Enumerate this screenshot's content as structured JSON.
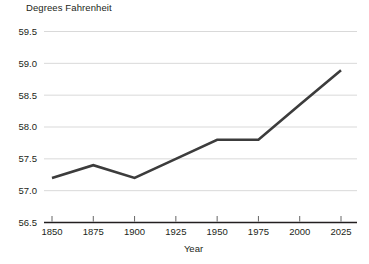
{
  "chart_data": {
    "type": "line",
    "title": "",
    "xlabel": "Year",
    "ylabel": "Degrees Fahrenheit",
    "x": [
      1850,
      1875,
      1900,
      1925,
      1950,
      1975,
      2000,
      2025
    ],
    "values": [
      57.2,
      57.4,
      57.2,
      57.5,
      57.8,
      57.8,
      58.35,
      58.89
    ],
    "series": [
      {
        "name": "Global average temperature",
        "values": [
          57.2,
          57.4,
          57.2,
          57.5,
          57.8,
          57.8,
          58.35,
          58.89
        ]
      }
    ],
    "xlim": [
      1850,
      2025
    ],
    "ylim": [
      56.5,
      59.5
    ],
    "x_ticks": [
      1850,
      1875,
      1900,
      1925,
      1950,
      1975,
      2000,
      2025
    ],
    "x_tick_labels": [
      "1850",
      "1875",
      "1900",
      "1925",
      "1950",
      "1975",
      "2000",
      "2025"
    ],
    "y_ticks": [
      56.5,
      57.0,
      57.5,
      58.0,
      58.5,
      59.0,
      59.5
    ],
    "y_tick_labels": [
      "56.5",
      "57.0",
      "57.5",
      "58.0",
      "58.5",
      "59.0",
      "59.5"
    ],
    "grid": true,
    "legend": "none",
    "line_color": "#3c3c3c",
    "gridline_color": "#c8c8c8",
    "axis_color": "#231f20",
    "background_color": "#ffffff"
  }
}
